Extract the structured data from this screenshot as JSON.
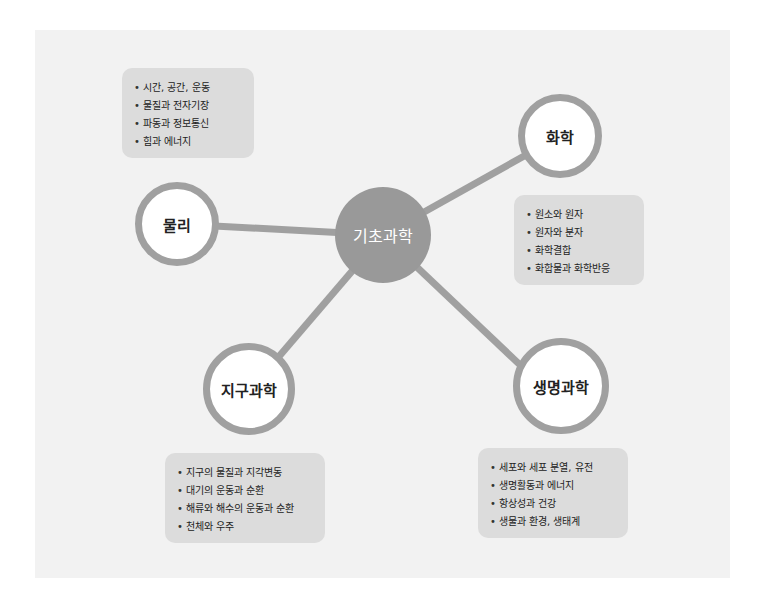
{
  "center": {
    "label": "기초과학"
  },
  "nodes": [
    {
      "id": "physics",
      "label": "물리",
      "items": [
        "시간, 공간, 운동",
        "물질과 전자기장",
        "파동과 정보통신",
        "힘과 에너지"
      ]
    },
    {
      "id": "chemistry",
      "label": "화학",
      "items": [
        "원소와 원자",
        "원자와 분자",
        "화학결합",
        "화합물과 화학반응"
      ]
    },
    {
      "id": "earth-science",
      "label": "지구과학",
      "items": [
        "지구의 물질과 지각변동",
        "대기의 운동과 순환",
        "해류와 해수의 운동과 순환",
        "천체와 우주"
      ]
    },
    {
      "id": "life-science",
      "label": "생명과학",
      "items": [
        "세포와 세포 분열, 유전",
        "생명활동과 에너지",
        "항상성과 건강",
        "생물과 환경, 생태계"
      ]
    }
  ],
  "colors": {
    "panel": "#f2f2f2",
    "connector": "#a0a0a0",
    "center_fill": "#999999",
    "box_fill": "#dcdcdc"
  }
}
